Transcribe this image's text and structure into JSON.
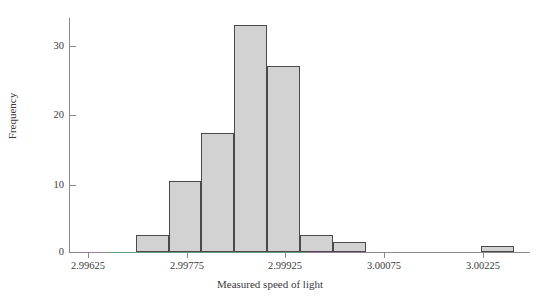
{
  "chart_data": {
    "type": "bar",
    "title": "",
    "subtitle": "",
    "xlabel": "Measured speed of light",
    "ylabel": "Frequency",
    "grid": false,
    "legend": null,
    "xlim": [
      2.99575,
      3.00275
    ],
    "ylim": [
      0,
      35
    ],
    "xtick_labels": [
      "2.99625",
      "2.99775",
      "2.99925",
      "3.00075",
      "3.00225"
    ],
    "xtick_values": [
      2.99625,
      2.99775,
      2.99925,
      3.00075,
      3.00225
    ],
    "ytick_labels": [
      "0",
      "10",
      "20",
      "30"
    ],
    "ytick_values": [
      0,
      10,
      20,
      30
    ],
    "bin_width": 0.0005,
    "bins": [
      {
        "left": 2.99675,
        "right": 2.99725,
        "value": 2.5
      },
      {
        "left": 2.99725,
        "right": 2.99775,
        "value": 10.6
      },
      {
        "left": 2.99775,
        "right": 2.99825,
        "value": 17.8
      },
      {
        "left": 2.99825,
        "right": 2.99875,
        "value": 33.9
      },
      {
        "left": 2.99875,
        "right": 2.99925,
        "value": 27.8
      },
      {
        "left": 2.99925,
        "right": 2.99975,
        "value": 2.5
      },
      {
        "left": 2.99975,
        "right": 3.00025,
        "value": 1.5
      },
      {
        "left": 3.002,
        "right": 3.0025,
        "value": 0.9
      }
    ],
    "categories": [
      "2.99675-2.99725",
      "2.99725-2.99775",
      "2.99775-2.99825",
      "2.99825-2.99875",
      "2.99875-2.99925",
      "2.99925-2.99975",
      "2.99975-3.00025",
      "3.00200-3.00250"
    ],
    "values": [
      2.5,
      10.6,
      17.8,
      33.9,
      27.8,
      2.5,
      1.5,
      0.9
    ],
    "colors": {
      "bar_fill": "#d2d2d2",
      "bar_edge": "#4a4a4a",
      "axis": "#8a8a8a",
      "text": "#3a3a3a",
      "background": "#ffffff"
    }
  }
}
